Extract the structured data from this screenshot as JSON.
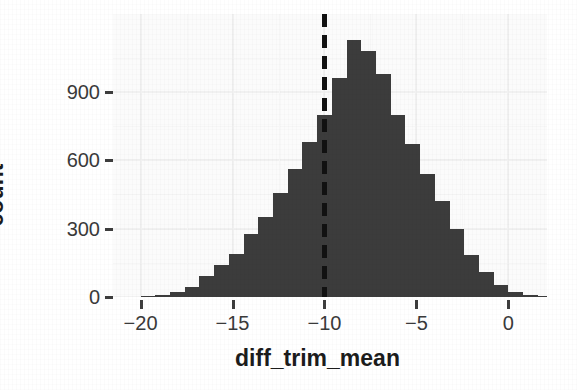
{
  "chart_data": {
    "type": "bar",
    "subtype": "histogram",
    "title": "",
    "xlabel": "diff_trim_mean",
    "ylabel": "count",
    "xlim": [
      -21.5,
      2.1
    ],
    "ylim": [
      0,
      1242
    ],
    "xticks": [
      -20,
      -15,
      -10,
      -5,
      0
    ],
    "xtick_labels": [
      "−20",
      "−15",
      "−10",
      "−5",
      "0"
    ],
    "yticks": [
      0,
      300,
      600,
      900
    ],
    "ytick_labels": [
      "0",
      "300",
      "600",
      "900"
    ],
    "grid": "major-and-minor, light gray on light panel",
    "legend": "none",
    "bar_color": "#3c3c3c",
    "panel_color": "#fbfbfb",
    "binwidth": 0.8,
    "annotations": [
      {
        "type": "vertical-dashed-line",
        "x": -10.05,
        "color": "#111111",
        "linetype": "dashed",
        "label": ""
      }
    ],
    "bins": [
      {
        "center": -19.6,
        "count": 4
      },
      {
        "center": -18.8,
        "count": 8
      },
      {
        "center": -18.0,
        "count": 22
      },
      {
        "center": -17.2,
        "count": 45
      },
      {
        "center": -16.4,
        "count": 92
      },
      {
        "center": -15.6,
        "count": 140
      },
      {
        "center": -14.8,
        "count": 190
      },
      {
        "center": -14.0,
        "count": 275
      },
      {
        "center": -13.2,
        "count": 350
      },
      {
        "center": -12.4,
        "count": 455
      },
      {
        "center": -11.6,
        "count": 560
      },
      {
        "center": -10.8,
        "count": 680
      },
      {
        "center": -10.0,
        "count": 800
      },
      {
        "center": -9.2,
        "count": 960
      },
      {
        "center": -8.4,
        "count": 1130
      },
      {
        "center": -7.6,
        "count": 1080
      },
      {
        "center": -6.8,
        "count": 980
      },
      {
        "center": -6.0,
        "count": 800
      },
      {
        "center": -5.2,
        "count": 670
      },
      {
        "center": -4.4,
        "count": 540
      },
      {
        "center": -3.6,
        "count": 420
      },
      {
        "center": -2.8,
        "count": 300
      },
      {
        "center": -2.0,
        "count": 185
      },
      {
        "center": -1.2,
        "count": 110
      },
      {
        "center": -0.4,
        "count": 52
      },
      {
        "center": 0.4,
        "count": 22
      },
      {
        "center": 1.2,
        "count": 8
      },
      {
        "center": 2.0,
        "count": 3
      }
    ],
    "categories": [
      "-19.6",
      "-18.8",
      "-18.0",
      "-17.2",
      "-16.4",
      "-15.6",
      "-14.8",
      "-14.0",
      "-13.2",
      "-12.4",
      "-11.6",
      "-10.8",
      "-10.0",
      "-9.2",
      "-8.4",
      "-7.6",
      "-6.8",
      "-6.0",
      "-5.2",
      "-4.4",
      "-3.6",
      "-2.8",
      "-2.0",
      "-1.2",
      "-0.4",
      "0.4",
      "1.2",
      "2.0"
    ],
    "values": [
      4,
      8,
      22,
      45,
      92,
      140,
      190,
      275,
      350,
      455,
      560,
      680,
      800,
      960,
      1130,
      1080,
      980,
      800,
      670,
      540,
      420,
      300,
      185,
      110,
      52,
      22,
      8,
      3
    ]
  }
}
